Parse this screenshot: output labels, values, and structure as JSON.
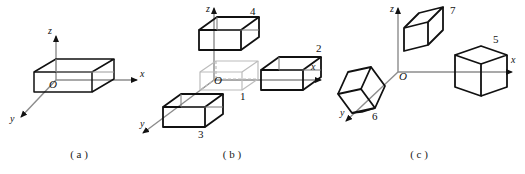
{
  "figure": {
    "background": "#ffffff",
    "ink": "#111111",
    "ghost_color": "#b9b9b9",
    "axis_color": "#8c8c8c",
    "panels": [
      {
        "id": "a",
        "caption": "( a )",
        "origin_label": "O",
        "axes": [
          {
            "name": "x",
            "label": "x"
          },
          {
            "name": "y",
            "label": "y"
          },
          {
            "name": "z",
            "label": "z"
          }
        ],
        "boxes": [
          {
            "label": "",
            "style": "solid",
            "position": "origin",
            "orientation": "axis-aligned"
          }
        ]
      },
      {
        "id": "b",
        "caption": "( b )",
        "origin_label": "O",
        "axes": [
          {
            "name": "x",
            "label": "x"
          },
          {
            "name": "y",
            "label": "y"
          },
          {
            "name": "z",
            "label": "z"
          }
        ],
        "boxes": [
          {
            "label": "1",
            "style": "ghost",
            "position": "origin",
            "orientation": "axis-aligned"
          },
          {
            "label": "2",
            "style": "solid",
            "position": "x-axis",
            "orientation": "axis-aligned"
          },
          {
            "label": "3",
            "style": "solid",
            "position": "y-axis",
            "orientation": "axis-aligned"
          },
          {
            "label": "4",
            "style": "solid",
            "position": "z-axis",
            "orientation": "axis-aligned"
          }
        ]
      },
      {
        "id": "c",
        "caption": "( c )",
        "origin_label": "O",
        "axes": [
          {
            "name": "x",
            "label": "x"
          },
          {
            "name": "y",
            "label": "y"
          },
          {
            "name": "z",
            "label": "z"
          }
        ],
        "boxes": [
          {
            "label": "5",
            "style": "solid",
            "position": "x-axis",
            "orientation": "rotated"
          },
          {
            "label": "6",
            "style": "solid",
            "position": "y-axis",
            "orientation": "rotated"
          },
          {
            "label": "7",
            "style": "solid",
            "position": "z-axis",
            "orientation": "rotated"
          }
        ]
      }
    ]
  },
  "labels": {
    "a_x": "x",
    "a_y": "y",
    "a_z": "z",
    "a_O": "O",
    "b_x": "x",
    "b_y": "y",
    "b_z": "z",
    "b_O": "O",
    "b_1": "1",
    "b_2": "2",
    "b_3": "3",
    "b_4": "4",
    "c_x": "x",
    "c_y": "y",
    "c_z": "z",
    "c_O": "O",
    "c_5": "5",
    "c_6": "6",
    "c_7": "7",
    "cap_a": "( a )",
    "cap_b": "( b )",
    "cap_c": "( c )"
  }
}
